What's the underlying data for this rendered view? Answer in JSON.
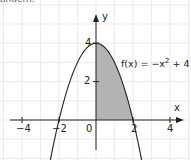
{
  "header": {
    "cut_text": "ändern."
  },
  "chart_data": {
    "type": "line",
    "title": "",
    "xlabel": "x",
    "ylabel": "y",
    "function_label": "f(x) = −x² + 4",
    "function_label_parts": {
      "prefix": "f(x) = −x",
      "exp": "2",
      "suffix": " + 4"
    },
    "xlim": [
      -5,
      5
    ],
    "ylim": [
      -2,
      5
    ],
    "x_ticks": [
      -4,
      -2,
      2,
      4
    ],
    "y_ticks": [
      2,
      4
    ],
    "origin_label": "0",
    "grid": true,
    "series": [
      {
        "name": "f(x) = -x^2 + 4",
        "x": [
          -2.5,
          -2,
          -1,
          0,
          1,
          2,
          2.5
        ],
        "y": [
          -2.25,
          0,
          3,
          4,
          3,
          0,
          -2.25
        ]
      }
    ],
    "shaded_region": {
      "from_x": 0,
      "to_x": 2,
      "under": "f(x)",
      "color": "#b3b3b3"
    }
  },
  "colors": {
    "grid": "#e6e6e6",
    "axis": "#222222",
    "curve": "#222222",
    "shade": "#b3b3b3"
  }
}
